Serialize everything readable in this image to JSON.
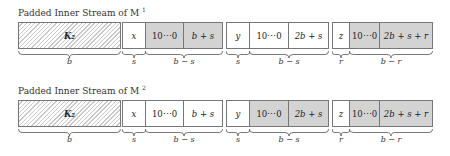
{
  "rows": [
    {
      "title": "Padded Inner Stream of M",
      "title_sup": "1",
      "cells": [
        {
          "label": "K₂",
          "style": "hatch"
        },
        {
          "label": "x",
          "style": "white"
        },
        {
          "label": "10⋯0",
          "style": "gray"
        },
        {
          "label": "b + s",
          "style": "gray"
        },
        {
          "label": "y",
          "style": "white"
        },
        {
          "label": "10⋯0",
          "style": "white"
        },
        {
          "label": "2b + s",
          "style": "white"
        },
        {
          "label": "z",
          "style": "white"
        },
        {
          "label": "10⋯0",
          "style": "gray"
        },
        {
          "label": "2b + s + r",
          "style": "gray"
        }
      ],
      "braces": [
        "b",
        "s",
        "b − s",
        "s",
        "b − s",
        "r",
        "b − r"
      ]
    },
    {
      "title": "Padded Inner Stream of M",
      "title_sup": "2",
      "cells": [
        {
          "label": "K₂",
          "style": "hatch"
        },
        {
          "label": "x",
          "style": "white"
        },
        {
          "label": "10⋯0",
          "style": "white"
        },
        {
          "label": "b + s",
          "style": "white"
        },
        {
          "label": "y",
          "style": "white"
        },
        {
          "label": "10⋯0",
          "style": "gray"
        },
        {
          "label": "2b + s",
          "style": "gray"
        },
        {
          "label": "z",
          "style": "white"
        },
        {
          "label": "10⋯0",
          "style": "gray"
        },
        {
          "label": "2b + s + r",
          "style": "gray"
        }
      ],
      "braces": [
        "b",
        "s",
        "b − s",
        "s",
        "b − s",
        "r",
        "b − r"
      ]
    }
  ],
  "colors": {
    "gray_fill": "#d3d3d3",
    "border": "#777777",
    "hatch": "#c8c8c8"
  }
}
